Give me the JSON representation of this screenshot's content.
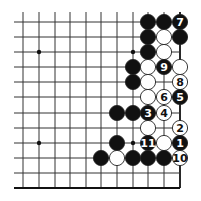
{
  "diagram": {
    "type": "go-board-fragment",
    "grid": {
      "columns_x": [
        23,
        39,
        55,
        70,
        86,
        101,
        117,
        133,
        148,
        164,
        180
      ],
      "rows_y": [
        22,
        37,
        52,
        67,
        82,
        97,
        113,
        128,
        143,
        158,
        173,
        188
      ],
      "top_line_start_y": 12,
      "left_line_start_x": 14,
      "right_edge_col": 10,
      "bottom_edge_row": 11,
      "line_color": "#333333",
      "edge_color": "#111111"
    },
    "star_points": [
      {
        "col": 1,
        "row": 2
      },
      {
        "col": 7,
        "row": 2
      },
      {
        "col": 1,
        "row": 8
      },
      {
        "col": 7,
        "row": 8
      }
    ],
    "stones": [
      {
        "col": 8,
        "row": 0,
        "color": "black",
        "label": ""
      },
      {
        "col": 9,
        "row": 0,
        "color": "black",
        "label": ""
      },
      {
        "col": 10,
        "row": 0,
        "color": "black",
        "label": "7"
      },
      {
        "col": 8,
        "row": 1,
        "color": "black",
        "label": ""
      },
      {
        "col": 9,
        "row": 1,
        "color": "white",
        "label": ""
      },
      {
        "col": 10,
        "row": 1,
        "color": "black",
        "label": ""
      },
      {
        "col": 8,
        "row": 2,
        "color": "black",
        "label": ""
      },
      {
        "col": 9,
        "row": 2,
        "color": "white",
        "label": ""
      },
      {
        "col": 7,
        "row": 3,
        "color": "black",
        "label": ""
      },
      {
        "col": 8,
        "row": 3,
        "color": "white",
        "label": ""
      },
      {
        "col": 9,
        "row": 3,
        "color": "black",
        "label": "9"
      },
      {
        "col": 10,
        "row": 3,
        "color": "white",
        "label": ""
      },
      {
        "col": 7,
        "row": 4,
        "color": "black",
        "label": ""
      },
      {
        "col": 8,
        "row": 4,
        "color": "white",
        "label": ""
      },
      {
        "col": 10,
        "row": 4,
        "color": "white",
        "label": "8"
      },
      {
        "col": 8,
        "row": 5,
        "color": "white",
        "label": ""
      },
      {
        "col": 9,
        "row": 5,
        "color": "white",
        "label": "6"
      },
      {
        "col": 10,
        "row": 5,
        "color": "black",
        "label": "5"
      },
      {
        "col": 6,
        "row": 6,
        "color": "black",
        "label": ""
      },
      {
        "col": 7,
        "row": 6,
        "color": "black",
        "label": ""
      },
      {
        "col": 8,
        "row": 6,
        "color": "black",
        "label": "3"
      },
      {
        "col": 9,
        "row": 6,
        "color": "white",
        "label": "4"
      },
      {
        "col": 8,
        "row": 7,
        "color": "white",
        "label": ""
      },
      {
        "col": 10,
        "row": 7,
        "color": "white",
        "label": "2"
      },
      {
        "col": 6,
        "row": 8,
        "color": "black",
        "label": ""
      },
      {
        "col": 8,
        "row": 8,
        "color": "black",
        "label": "11"
      },
      {
        "col": 9,
        "row": 8,
        "color": "white",
        "label": ""
      },
      {
        "col": 10,
        "row": 8,
        "color": "black",
        "label": "1"
      },
      {
        "col": 5,
        "row": 9,
        "color": "black",
        "label": ""
      },
      {
        "col": 6,
        "row": 9,
        "color": "white",
        "label": ""
      },
      {
        "col": 7,
        "row": 9,
        "color": "black",
        "label": ""
      },
      {
        "col": 8,
        "row": 9,
        "color": "black",
        "label": ""
      },
      {
        "col": 9,
        "row": 9,
        "color": "black",
        "label": ""
      },
      {
        "col": 10,
        "row": 9,
        "color": "white",
        "label": "10"
      }
    ],
    "stone_radius": 7.6,
    "colors": {
      "black": "#111111",
      "white": "#ffffff",
      "outline": "#222222"
    }
  }
}
